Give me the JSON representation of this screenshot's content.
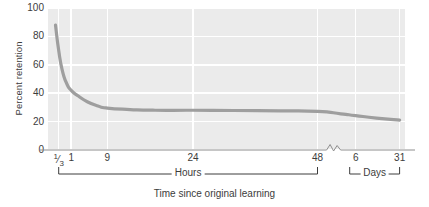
{
  "chart_data": {
    "type": "line",
    "title": "",
    "caption": "Time since original learning",
    "ylabel": "Percent retention",
    "xlabel": "",
    "ylim": [
      0,
      100
    ],
    "yticks": [
      100,
      80,
      60,
      40,
      20,
      0
    ],
    "grid": true,
    "legend": null,
    "axis_break": true,
    "axis_break_note": "scale break between 48 hours and 6 days",
    "x_ticks": [
      {
        "label": "1/3",
        "numerator": "1",
        "denominator": "3",
        "is_fraction": true,
        "unit": "hours",
        "pos": 0.03
      },
      {
        "label": "1",
        "is_fraction": false,
        "unit": "hours",
        "pos": 0.065
      },
      {
        "label": "9",
        "is_fraction": false,
        "unit": "hours",
        "pos": 0.166
      },
      {
        "label": "24",
        "is_fraction": false,
        "unit": "hours",
        "pos": 0.406
      },
      {
        "label": "48",
        "is_fraction": false,
        "unit": "hours",
        "pos": 0.755
      },
      {
        "label": "6",
        "is_fraction": false,
        "unit": "days",
        "pos": 0.862
      },
      {
        "label": "31",
        "is_fraction": false,
        "unit": "days",
        "pos": 0.985
      }
    ],
    "group_brackets": [
      {
        "label": "Hours",
        "start": 0.03,
        "end": 0.755
      },
      {
        "label": "Days",
        "start": 0.845,
        "end": 0.985
      }
    ],
    "series": [
      {
        "name": "Retention",
        "color": "#9e9e9e",
        "points": [
          {
            "x": 0.021,
            "y": 88
          },
          {
            "x": 0.03,
            "y": 70
          },
          {
            "x": 0.04,
            "y": 56
          },
          {
            "x": 0.052,
            "y": 47
          },
          {
            "x": 0.065,
            "y": 42
          },
          {
            "x": 0.085,
            "y": 38
          },
          {
            "x": 0.11,
            "y": 34
          },
          {
            "x": 0.14,
            "y": 31
          },
          {
            "x": 0.166,
            "y": 29.5
          },
          {
            "x": 0.23,
            "y": 28.5
          },
          {
            "x": 0.3,
            "y": 28
          },
          {
            "x": 0.406,
            "y": 28
          },
          {
            "x": 0.52,
            "y": 27.8
          },
          {
            "x": 0.65,
            "y": 27.6
          },
          {
            "x": 0.755,
            "y": 27.2
          },
          {
            "x": 0.82,
            "y": 25.5
          },
          {
            "x": 0.862,
            "y": 24.2
          },
          {
            "x": 0.92,
            "y": 22.5
          },
          {
            "x": 0.985,
            "y": 21
          }
        ]
      }
    ]
  }
}
